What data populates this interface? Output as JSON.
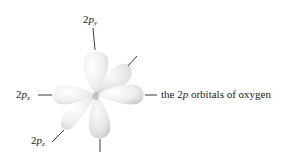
{
  "figure": {
    "title": "the 2p orbitals of oxygen",
    "caption_label": "the 2p orbitals of oxygen",
    "labels": {
      "py": {
        "prefix": "2",
        "italic": "p",
        "sub": "y"
      },
      "px": {
        "prefix": "2",
        "italic": "p",
        "sub": "x"
      },
      "pz": {
        "prefix": "2",
        "italic": "p",
        "sub": "z"
      },
      "caption": {
        "before": "the 2",
        "italic": "p",
        "after": " orbitals of oxygen"
      }
    },
    "colors": {
      "lobe_fill": "#eeeeee",
      "lobe_shadow": "#c8c8c8",
      "line": "#222222",
      "text": "#222222"
    }
  }
}
